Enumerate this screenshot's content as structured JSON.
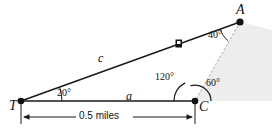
{
  "figure": {
    "type": "geometry-diagram",
    "stroke_color": "#1a1a1a",
    "dashed_color": "#b0b0b0",
    "shade_color": "#ececec"
  },
  "vertices": [
    {
      "id": "T",
      "label": "T",
      "x": 21,
      "y": 101
    },
    {
      "id": "C",
      "label": "C",
      "x": 195,
      "y": 101
    },
    {
      "id": "A",
      "label": "A",
      "x": 240,
      "y": 22
    }
  ],
  "sides": [
    {
      "id": "c",
      "label": "c",
      "from": "T",
      "to": "A",
      "label_x": 98,
      "label_y": 52
    },
    {
      "id": "a",
      "label": "a",
      "from": "T",
      "to": "C",
      "label_x": 126,
      "label_y": 91
    }
  ],
  "angles": [
    {
      "id": "angle-T",
      "label": "20°",
      "at": "T",
      "label_x": 57,
      "label_y": 90
    },
    {
      "id": "angle-A",
      "label": "40°",
      "at": "A",
      "label_x": 210,
      "label_y": 32
    },
    {
      "id": "angle-C-interior",
      "label": "120°",
      "at": "C",
      "label_x": 159,
      "label_y": 74
    },
    {
      "id": "angle-C-exterior",
      "label": "60°",
      "at": "C",
      "label_x": 207,
      "label_y": 80
    }
  ],
  "dimension": {
    "id": "baseline-dimension",
    "label": "0.5 miles",
    "from": "T",
    "to": "C",
    "label_x": 85,
    "label_y": 115
  },
  "marker": {
    "id": "object-marker",
    "shape": "filled-square",
    "x": 178,
    "y": 42
  }
}
